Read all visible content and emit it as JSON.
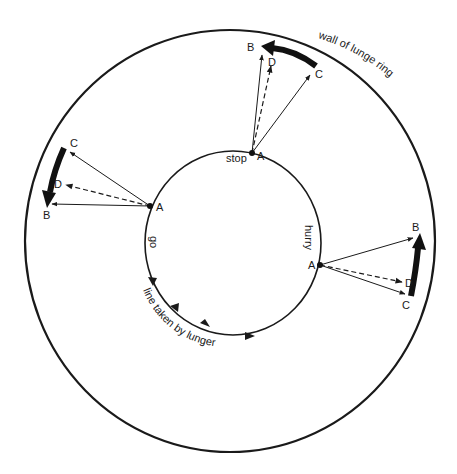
{
  "labels": {
    "wall": "wall of lunge ring",
    "path": "line taken by lunger",
    "stop": "stop",
    "go": "go",
    "hurry": "hurry"
  },
  "points": {
    "a": "A",
    "b": "B",
    "c": "C",
    "d": "D"
  },
  "colors": {
    "ink": "#1a1a1a",
    "background": "#ffffff"
  },
  "groups": [
    {
      "name": "stop",
      "A": [
        252,
        153
      ],
      "B": [
        263,
        53
      ],
      "C": [
        312,
        72
      ],
      "D": [
        272,
        64
      ]
    },
    {
      "name": "go",
      "A": [
        150,
        206
      ],
      "B": [
        49,
        204
      ],
      "C": [
        68,
        151
      ],
      "D": [
        64,
        184
      ]
    },
    {
      "name": "hurry",
      "A": [
        320,
        265
      ],
      "B": [
        415,
        237
      ],
      "C": [
        407,
        295
      ],
      "D": [
        404,
        282
      ]
    }
  ]
}
